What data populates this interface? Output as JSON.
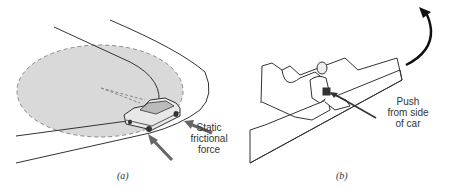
{
  "figure": {
    "panel_a": {
      "caption": "(a)",
      "label_line1": "Static",
      "label_line2": "frictional",
      "label_line3": "force",
      "colors": {
        "disk": "#d9d9d9",
        "disk_border": "#888888",
        "arrow": "#666666",
        "road": "#333333"
      }
    },
    "panel_b": {
      "caption": "(b)",
      "label_line1": "Push",
      "label_line2": "from side",
      "label_line3": "of car",
      "colors": {
        "outline": "#333333",
        "curve_arrow": "#111111"
      }
    }
  }
}
